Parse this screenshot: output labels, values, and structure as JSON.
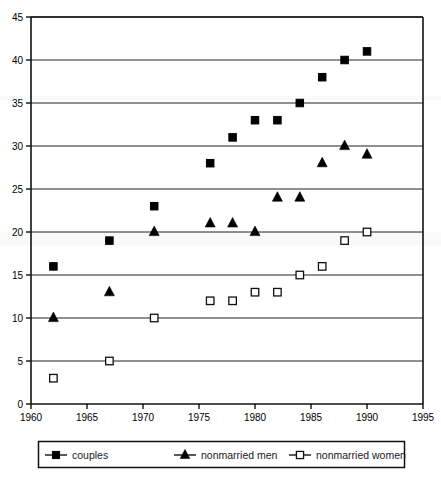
{
  "chart_data": {
    "type": "scatter",
    "title": "",
    "subtitle": "",
    "xlabel": "",
    "ylabel": "",
    "xlim": [
      1960,
      1995
    ],
    "ylim": [
      0,
      45
    ],
    "xticks": [
      1960,
      1965,
      1970,
      1975,
      1980,
      1985,
      1990,
      1995
    ],
    "yticks": [
      0,
      5,
      10,
      15,
      20,
      25,
      30,
      35,
      40,
      45
    ],
    "grid": "horizontal",
    "legend_position": "bottom",
    "series": [
      {
        "name": "couples",
        "marker": "filled-square",
        "color": "#000000",
        "x": [
          1962,
          1967,
          1971,
          1976,
          1978,
          1980,
          1982,
          1984,
          1986,
          1988,
          1990
        ],
        "values": [
          16,
          19,
          23,
          28,
          31,
          33,
          33,
          35,
          38,
          40,
          41
        ]
      },
      {
        "name": "nonmarried men",
        "marker": "filled-triangle",
        "color": "#000000",
        "x": [
          1962,
          1967,
          1971,
          1976,
          1978,
          1980,
          1982,
          1984,
          1986,
          1988,
          1990
        ],
        "values": [
          10,
          13,
          20,
          21,
          21,
          20,
          24,
          24,
          28,
          30,
          29
        ]
      },
      {
        "name": "nonmarried women",
        "marker": "open-square",
        "color": "#000000",
        "x": [
          1962,
          1967,
          1971,
          1976,
          1978,
          1980,
          1982,
          1984,
          1986,
          1988,
          1990
        ],
        "values": [
          3,
          5,
          10,
          12,
          12,
          13,
          13,
          15,
          16,
          19,
          20
        ]
      }
    ]
  },
  "axis": {
    "x_tick_labels": [
      "1960",
      "1965",
      "1970",
      "1975",
      "1980",
      "1985",
      "1990",
      "1995"
    ],
    "y_tick_labels": [
      "0",
      "5",
      "10",
      "15",
      "20",
      "25",
      "30",
      "35",
      "40",
      "45"
    ]
  },
  "legend": {
    "items": [
      {
        "label": "couples",
        "marker": "filled-square"
      },
      {
        "label": "nonmarried men",
        "marker": "filled-triangle"
      },
      {
        "label": "nonmarried women",
        "marker": "open-square"
      }
    ]
  }
}
